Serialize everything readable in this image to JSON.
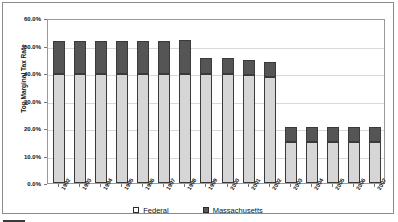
{
  "chart_data": {
    "type": "bar",
    "stacked": true,
    "title": "",
    "xlabel": "",
    "ylabel": "Top Marginal Tax Rate",
    "ylim": [
      0,
      60
    ],
    "ytick_labels": [
      "0.0%",
      "10.0%",
      "20.0%",
      "30.0%",
      "40.0%",
      "50.0%",
      "60.0%"
    ],
    "ytick_values": [
      0,
      10,
      20,
      30,
      40,
      50,
      60
    ],
    "grid": true,
    "legend_position": "bottom",
    "categories": [
      "1992",
      "1993",
      "1994",
      "1995",
      "1996",
      "1997",
      "1998",
      "1999",
      "2000",
      "2001",
      "2002",
      "2003",
      "2004",
      "2005",
      "2006",
      "2007"
    ],
    "series": [
      {
        "name": "Federal",
        "color": "#d6d6d6",
        "values": [
          39.6,
          39.6,
          39.6,
          39.6,
          39.6,
          39.6,
          39.6,
          39.6,
          39.6,
          39.1,
          38.6,
          15.0,
          15.0,
          15.0,
          15.0,
          15.0
        ]
      },
      {
        "name": "Massachusetts",
        "color": "#555555",
        "values": [
          12.0,
          12.0,
          12.0,
          12.0,
          12.0,
          12.0,
          12.5,
          6.0,
          5.95,
          5.6,
          5.3,
          5.3,
          5.3,
          5.3,
          5.3,
          5.3
        ]
      }
    ],
    "totals": [
      51.6,
      51.6,
      51.6,
      51.6,
      51.6,
      51.6,
      52.1,
      45.6,
      45.55,
      44.7,
      43.9,
      20.3,
      20.3,
      20.3,
      20.3,
      20.3
    ]
  },
  "legend": {
    "items": [
      {
        "label": "Federal",
        "swatch": "federal-swatch"
      },
      {
        "label": "Massachusetts",
        "swatch": "massachusetts-swatch"
      }
    ]
  }
}
